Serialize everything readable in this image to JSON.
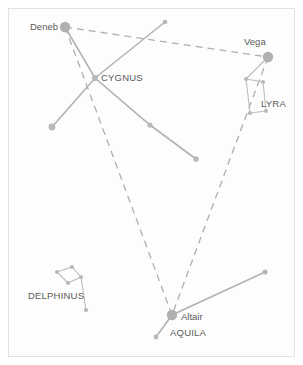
{
  "chart_data": {
    "type": "scatter",
    "xlabel": "",
    "ylabel": "",
    "xlim": [
      0,
      303
    ],
    "ylim": [
      0,
      365
    ],
    "grid": false,
    "legend": "none",
    "background_color": "#fdfdfd",
    "border_color": "#e2e2e2",
    "line_color": "#b3b3b3",
    "star_color": "#b0b0b0",
    "label_color": "#5a5a5a",
    "stars": [
      {
        "name": "Deneb",
        "x": 65,
        "y": 27,
        "r": 5.2,
        "label": "Deneb",
        "label_x": 30,
        "label_y": 30
      },
      {
        "name": "Vega",
        "x": 268,
        "y": 57,
        "r": 5.2,
        "label": "Vega",
        "label_x": 244,
        "label_y": 45
      },
      {
        "name": "Altair",
        "x": 172,
        "y": 315,
        "r": 5.2,
        "label": "Altair",
        "label_x": 181,
        "label_y": 320
      },
      {
        "name": "Sadr",
        "x": 95,
        "y": 78,
        "r": 3.0,
        "label": "",
        "label_x": 0,
        "label_y": 0
      },
      {
        "name": "Cygnus-NE",
        "x": 165,
        "y": 22,
        "r": 2.3,
        "label": "",
        "label_x": 0,
        "label_y": 0
      },
      {
        "name": "Cygnus-SW",
        "x": 52,
        "y": 127,
        "r": 3.4,
        "label": "",
        "label_x": 0,
        "label_y": 0
      },
      {
        "name": "Cygnus-mid-SE",
        "x": 150,
        "y": 125,
        "r": 2.6,
        "label": "",
        "label_x": 0,
        "label_y": 0
      },
      {
        "name": "Cygnus-SE",
        "x": 196,
        "y": 159,
        "r": 2.8,
        "label": "",
        "label_x": 0,
        "label_y": 0
      },
      {
        "name": "Lyra-NW",
        "x": 246,
        "y": 79,
        "r": 2.1,
        "label": "",
        "label_x": 0,
        "label_y": 0
      },
      {
        "name": "Lyra-NE",
        "x": 263,
        "y": 82,
        "r": 2.1,
        "label": "",
        "label_x": 0,
        "label_y": 0
      },
      {
        "name": "Lyra-SW",
        "x": 250,
        "y": 113,
        "r": 2.1,
        "label": "",
        "label_x": 0,
        "label_y": 0
      },
      {
        "name": "Lyra-SE",
        "x": 266,
        "y": 111,
        "r": 2.1,
        "label": "",
        "label_x": 0,
        "label_y": 0
      },
      {
        "name": "Aquila-NE",
        "x": 265,
        "y": 272,
        "r": 2.6,
        "label": "",
        "label_x": 0,
        "label_y": 0
      },
      {
        "name": "Aquila-SW",
        "x": 156,
        "y": 337,
        "r": 2.4,
        "label": "",
        "label_x": 0,
        "label_y": 0
      },
      {
        "name": "Delphinus-W",
        "x": 57,
        "y": 272,
        "r": 2.1,
        "label": "",
        "label_x": 0,
        "label_y": 0
      },
      {
        "name": "Delphinus-N",
        "x": 72,
        "y": 267,
        "r": 2.1,
        "label": "",
        "label_x": 0,
        "label_y": 0
      },
      {
        "name": "Delphinus-E",
        "x": 81,
        "y": 277,
        "r": 2.1,
        "label": "",
        "label_x": 0,
        "label_y": 0
      },
      {
        "name": "Delphinus-S",
        "x": 68,
        "y": 283,
        "r": 2.1,
        "label": "",
        "label_x": 0,
        "label_y": 0
      },
      {
        "name": "Delphinus-tail",
        "x": 86,
        "y": 310,
        "r": 2.1,
        "label": "",
        "label_x": 0,
        "label_y": 0
      }
    ],
    "constellation_labels": [
      {
        "name": "CYGNUS",
        "text": "CYGNUS",
        "x": 101,
        "y": 81
      },
      {
        "name": "LYRA",
        "text": "LYRA",
        "x": 261,
        "y": 107
      },
      {
        "name": "AQUILA",
        "text": "AQUILA",
        "x": 170,
        "y": 336
      },
      {
        "name": "DELPHINUS",
        "text": "DELPHINUS",
        "x": 28,
        "y": 299
      }
    ],
    "star_labels": [
      {
        "name": "Deneb",
        "text": "Deneb",
        "x": 30,
        "y": 30
      },
      {
        "name": "Vega",
        "text": "Vega",
        "x": 244,
        "y": 45
      },
      {
        "name": "Altair",
        "text": "Altair",
        "x": 181,
        "y": 320
      }
    ],
    "asterism_lines": [
      {
        "name": "cygnus-spine",
        "points": "65,27 95,78 150,125 196,159"
      },
      {
        "name": "cygnus-crossbar",
        "points": "165,22 95,78 52,127"
      },
      {
        "name": "aquila-wing",
        "points": "265,272 172,315 156,337"
      },
      {
        "name": "lyra-parallelogram",
        "points": "246,79 263,82 266,111 250,113 246,79"
      },
      {
        "name": "lyra-vega-link",
        "points": "268,57 246,79"
      },
      {
        "name": "delphinus-body",
        "points": "57,272 72,267 81,277 68,283 57,272"
      },
      {
        "name": "delphinus-tail",
        "points": "81,277 86,310"
      }
    ],
    "triangle_lines": [
      {
        "name": "deneb-vega",
        "from": "Deneb",
        "to": "Vega",
        "points": "65,27 268,57"
      },
      {
        "name": "deneb-altair",
        "from": "Deneb",
        "to": "Altair",
        "points": "65,27 172,315"
      },
      {
        "name": "vega-altair",
        "from": "Vega",
        "to": "Altair",
        "points": "268,57 172,315"
      }
    ]
  }
}
